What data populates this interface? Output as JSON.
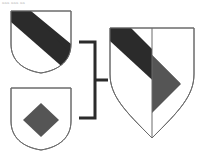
{
  "figure": {
    "kind": "heraldic-marshalling-diagram",
    "background_color": "#ffffff",
    "corner_note": "aaa aaa  aa",
    "width": 205,
    "height": 159
  },
  "palette": {
    "field": "#ffffff",
    "sable": "#2b2b2b",
    "gray_charge": "#555555",
    "outline": "#6b6b6b",
    "bracket": "#2b2b2b"
  },
  "shields": [
    {
      "id": "paternal-arms",
      "name": "shield-top-left",
      "role": "parent-arms-1",
      "blazon": "Argent, a bend sable",
      "field_tincture": "argent",
      "field_color": "#ffffff",
      "charges": [
        {
          "name": "bend",
          "tincture": "sable",
          "color": "#2b2b2b",
          "orientation": "dexter-chief-to-sinister-base"
        }
      ],
      "outline_color": "#6b6b6b",
      "bounds": {
        "x": 11,
        "y": 11,
        "width": 60,
        "height": 62
      }
    },
    {
      "id": "maternal-arms",
      "name": "shield-bottom-left",
      "role": "parent-arms-2",
      "blazon": "Argent, a lozenge sable",
      "field_tincture": "argent",
      "field_color": "#ffffff",
      "charges": [
        {
          "name": "lozenge",
          "tincture": "gray",
          "color": "#555555",
          "orientation": "upright-diamond"
        }
      ],
      "outline_color": "#6b6b6b",
      "bounds": {
        "x": 11,
        "y": 88,
        "width": 60,
        "height": 62
      }
    },
    {
      "id": "impaled-arms",
      "name": "shield-right-combined",
      "role": "combined-arms",
      "blazon": "Per pale: dexter, a bend sable; sinister, a lozenge gray",
      "field_tincture": "argent",
      "field_color": "#ffffff",
      "division": "per pale",
      "charges": [
        {
          "name": "bend",
          "tincture": "sable",
          "color": "#2b2b2b",
          "half": "dexter"
        },
        {
          "name": "half-lozenge",
          "tincture": "gray",
          "color": "#555555",
          "half": "sinister"
        }
      ],
      "outline_color": "#6b6b6b",
      "bounds": {
        "x": 110,
        "y": 28,
        "width": 84,
        "height": 110
      }
    }
  ],
  "connector": {
    "name": "marshalling-bracket",
    "color": "#2b2b2b",
    "stroke_width": 3,
    "top_y": 42,
    "bottom_y": 118,
    "left_x": 79,
    "right_x": 95,
    "stem_y": 80,
    "stem_end_x": 108
  }
}
